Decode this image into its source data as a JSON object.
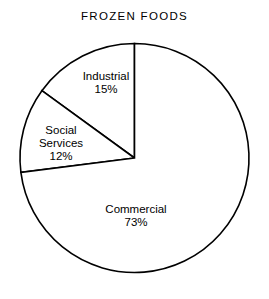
{
  "chart_data": {
    "type": "pie",
    "title": "FROZEN FOODS",
    "categories": [
      "Industrial",
      "Social\nServices",
      "Commercial"
    ],
    "values": [
      15,
      12,
      73
    ],
    "value_labels": [
      "15%",
      "12%",
      "73%"
    ],
    "units": "percent",
    "total": 100,
    "start_angle_deg": 90,
    "direction": "counterclockwise",
    "legend": "none",
    "grid": false,
    "slice_fill": "#ffffff",
    "slice_stroke": "#000000",
    "background": "#ffffff",
    "slices": [
      {
        "label": "Industrial",
        "value": 15,
        "value_label": "15%",
        "sweep_deg": 54.0
      },
      {
        "label": "Social\nServices",
        "value": 12,
        "value_label": "12%",
        "sweep_deg": 43.2
      },
      {
        "label": "Commercial",
        "value": 73,
        "value_label": "73%",
        "sweep_deg": 262.8
      }
    ]
  },
  "figure": {
    "title": "FROZEN FOODS",
    "industrial": {
      "name": "Industrial",
      "value_label": "15%"
    },
    "social_services": {
      "name": "Social\nServices",
      "value_label": "12%"
    },
    "commercial": {
      "name": "Commercial",
      "value_label": "73%"
    }
  }
}
